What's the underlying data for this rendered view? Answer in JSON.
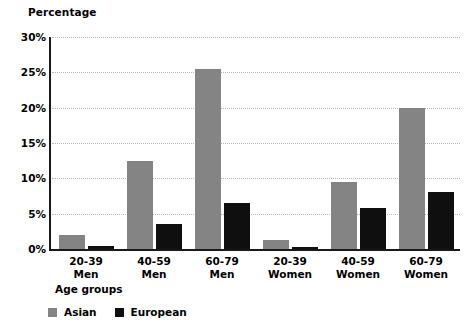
{
  "chart_data": {
    "type": "bar",
    "title": "",
    "ylabel": "Percentage",
    "xlabel": "Age groups",
    "categories": [
      {
        "line1": "20-39",
        "line2": "Men"
      },
      {
        "line1": "40-59",
        "line2": "Men"
      },
      {
        "line1": "60-79",
        "line2": "Men"
      },
      {
        "line1": "20-39",
        "line2": "Women"
      },
      {
        "line1": "40-59",
        "line2": "Women"
      },
      {
        "line1": "60-79",
        "line2": "Women"
      }
    ],
    "series": [
      {
        "name": "Asian",
        "color": "#848484",
        "values": [
          2.0,
          12.5,
          25.5,
          1.3,
          9.5,
          20.0
        ]
      },
      {
        "name": "European",
        "color": "#0f0f0f",
        "values": [
          0.4,
          3.5,
          6.5,
          0.3,
          5.8,
          8.0
        ]
      }
    ],
    "ylim": [
      0,
      30
    ],
    "ytick_step": 5,
    "ytick_labels": [
      "0%",
      "5%",
      "10%",
      "15%",
      "20%",
      "25%",
      "30%"
    ],
    "grid": true,
    "grid_style": "dotted",
    "legend_position": "bottom-left"
  }
}
